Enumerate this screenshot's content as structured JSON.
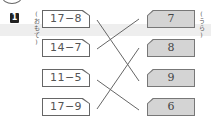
{
  "problem": {
    "number": "1",
    "left_label": "(おもて)",
    "right_label": "(うら)"
  },
  "left_cards": [
    {
      "expression": "17−8"
    },
    {
      "expression": "14−7"
    },
    {
      "expression": "11−5"
    },
    {
      "expression": "17−9"
    }
  ],
  "right_cards": [
    {
      "answer": "7"
    },
    {
      "answer": "8"
    },
    {
      "answer": "9"
    },
    {
      "answer": "6"
    }
  ],
  "connections": [
    {
      "from": "17−8",
      "to": "9"
    },
    {
      "from": "14−7",
      "to": "7"
    },
    {
      "from": "11−5",
      "to": "6"
    },
    {
      "from": "17−9",
      "to": "8"
    }
  ],
  "colors": {
    "card_front": "#ffffff",
    "card_back": "#d4d4d4",
    "line": "#666666"
  }
}
